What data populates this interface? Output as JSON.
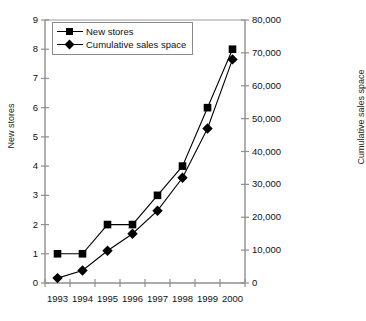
{
  "chart_data": {
    "type": "line",
    "title": "",
    "xlabel": "",
    "categories": [
      "1993",
      "1994",
      "1995",
      "1996",
      "1997",
      "1998",
      "1999",
      "2000"
    ],
    "grid": false,
    "legend_position": "inside-top-left",
    "axes": {
      "left": {
        "label": "New stores",
        "ylim": [
          0,
          9
        ],
        "ticks": [
          "0",
          "1",
          "2",
          "3",
          "4",
          "5",
          "6",
          "7",
          "8",
          "9"
        ],
        "tick_step": 1
      },
      "right": {
        "label": "Cumulative sales space",
        "ylim": [
          0,
          80000
        ],
        "ticks": [
          "0",
          "10,000",
          "20,000",
          "30,000",
          "40,000",
          "50,000",
          "60,000",
          "70,000",
          "80,000"
        ],
        "tick_step": 10000
      }
    },
    "series": [
      {
        "name": "New stores",
        "axis": "left",
        "marker": "square",
        "color": "#000000",
        "values": [
          1,
          1,
          2,
          2,
          3,
          4,
          6,
          8
        ]
      },
      {
        "name": "Cumulative sales space",
        "axis": "right",
        "marker": "diamond",
        "color": "#000000",
        "values": [
          1500,
          3800,
          9800,
          15000,
          22000,
          32000,
          47000,
          68000
        ]
      }
    ]
  },
  "legend": {
    "items": [
      {
        "label": "New stores",
        "marker": "square"
      },
      {
        "label": "Cumulative sales space",
        "marker": "diamond"
      }
    ]
  },
  "caption": {
    "text": ""
  }
}
